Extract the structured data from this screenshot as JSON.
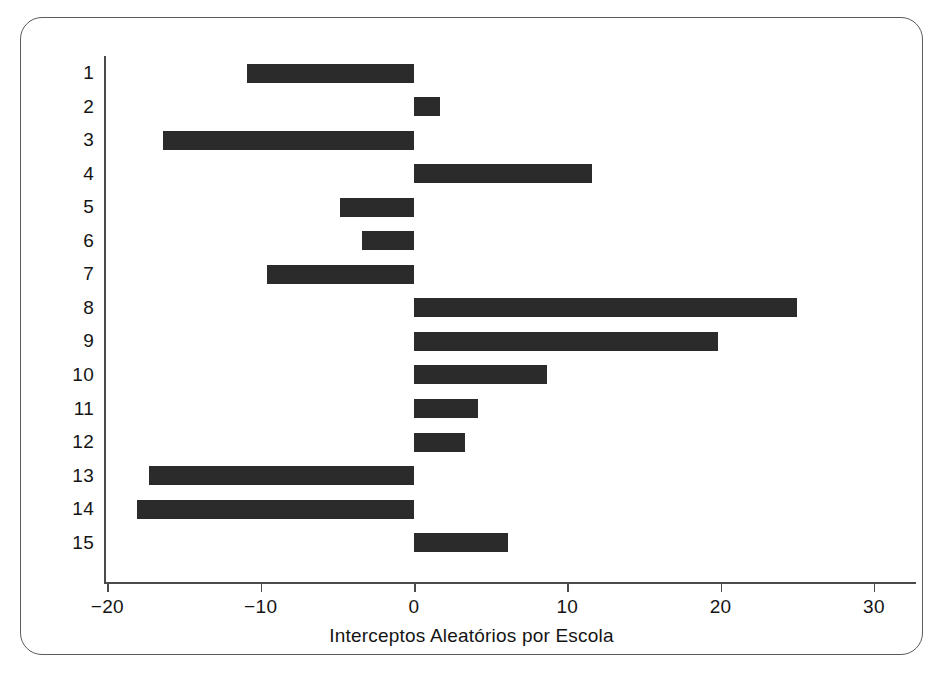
{
  "chart_data": {
    "type": "bar",
    "orientation": "horizontal",
    "title": "",
    "subtitle": "",
    "xlabel": "Interceptos Aleatórios por Escola",
    "ylabel": "",
    "xlim": [
      -23,
      31.5
    ],
    "ylim": [
      0.5,
      15.5
    ],
    "grid": false,
    "legend": null,
    "bar_color": "#2b2b2b",
    "axis_color": "#4a4a4a",
    "frame_color": "#5b5b5b",
    "x_ticks": [
      -20,
      -10,
      0,
      10,
      20,
      30
    ],
    "x_tick_labels": [
      "−20",
      "−10",
      "0",
      "10",
      "20",
      "30"
    ],
    "y_ticks": [
      1,
      2,
      3,
      4,
      5,
      6,
      7,
      8,
      9,
      10,
      11,
      12,
      13,
      14,
      15
    ],
    "y_tick_labels": [
      "1",
      "2",
      "3",
      "4",
      "5",
      "6",
      "7",
      "8",
      "9",
      "10",
      "11",
      "12",
      "13",
      "14",
      "15"
    ],
    "categories": [
      "1",
      "2",
      "3",
      "4",
      "5",
      "6",
      "7",
      "8",
      "9",
      "10",
      "11",
      "12",
      "13",
      "14",
      "15"
    ],
    "values": [
      -10.9,
      1.7,
      -16.4,
      11.6,
      -4.8,
      -3.4,
      -9.6,
      25.0,
      19.8,
      8.7,
      4.2,
      3.3,
      -17.3,
      -18.1,
      6.1
    ],
    "baseline": 0
  }
}
